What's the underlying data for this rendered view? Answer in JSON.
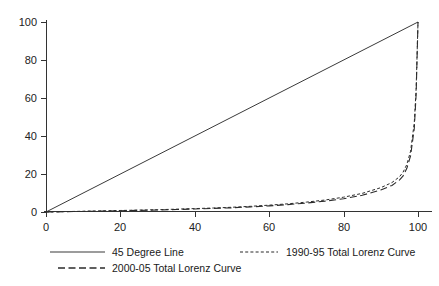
{
  "chart_data": {
    "type": "line",
    "title": "",
    "xlabel": "",
    "ylabel": "",
    "xlim": [
      0,
      100
    ],
    "ylim": [
      0,
      100
    ],
    "grid": false,
    "legend_position": "bottom",
    "x_ticks": [
      "0",
      "20",
      "40",
      "60",
      "80",
      "100"
    ],
    "x_tick_values": [
      0,
      20,
      40,
      60,
      80,
      100
    ],
    "y_ticks": [
      "0",
      "20",
      "40",
      "60",
      "80",
      "100"
    ],
    "y_tick_values": [
      0,
      20,
      40,
      60,
      80,
      100
    ],
    "series": [
      {
        "name": "45 Degree Line",
        "style": "solid",
        "x": [
          0,
          100
        ],
        "values": [
          0,
          100
        ]
      },
      {
        "name": "1990-95 Total Lorenz Curve",
        "style": "dotted",
        "x": [
          0,
          5,
          10,
          15,
          20,
          25,
          30,
          35,
          40,
          45,
          50,
          55,
          60,
          65,
          70,
          75,
          80,
          85,
          90,
          93,
          95,
          96,
          97,
          98,
          99,
          99.5,
          100
        ],
        "values": [
          0,
          0.2,
          0.4,
          0.6,
          0.8,
          1.0,
          1.2,
          1.5,
          1.8,
          2.1,
          2.5,
          3.0,
          3.6,
          4.3,
          5.2,
          6.3,
          7.8,
          9.8,
          12.8,
          15.5,
          18.5,
          21.0,
          25.0,
          32.0,
          47.0,
          65.0,
          100
        ]
      },
      {
        "name": "2000-05 Total Lorenz Curve",
        "style": "dashed",
        "x": [
          0,
          5,
          10,
          15,
          20,
          25,
          30,
          35,
          40,
          45,
          50,
          55,
          60,
          65,
          70,
          75,
          80,
          85,
          90,
          93,
          95,
          96,
          97,
          98,
          99,
          99.5,
          100
        ],
        "values": [
          0,
          0.15,
          0.3,
          0.45,
          0.65,
          0.85,
          1.05,
          1.3,
          1.6,
          1.9,
          2.2,
          2.7,
          3.2,
          3.9,
          4.7,
          5.7,
          7.0,
          8.8,
          11.6,
          14.0,
          16.8,
          19.0,
          23.0,
          29.5,
          44.0,
          62.0,
          100
        ]
      }
    ],
    "legend": [
      {
        "label": "45 Degree Line",
        "style": "solid"
      },
      {
        "label": "1990-95 Total Lorenz Curve",
        "style": "dotted"
      },
      {
        "label": "2000-05 Total Lorenz Curve",
        "style": "dashed"
      }
    ]
  }
}
